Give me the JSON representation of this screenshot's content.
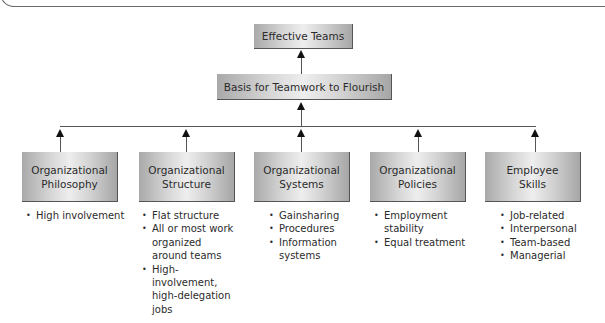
{
  "diagram": {
    "top": {
      "label": "Effective Teams"
    },
    "middle": {
      "label": "Basis for Teamwork to Flourish"
    },
    "factors": [
      {
        "line1": "Organizational",
        "line2": "Philosophy",
        "bullets": [
          "High involvement"
        ]
      },
      {
        "line1": "Organizational",
        "line2": "Structure",
        "bullets": [
          "Flat structure",
          "All or most work organized around teams",
          "High-involvement, high-delegation jobs"
        ]
      },
      {
        "line1": "Organizational",
        "line2": "Systems",
        "bullets": [
          "Gainsharing",
          "Procedures",
          "Information systems"
        ]
      },
      {
        "line1": "Organizational",
        "line2": "Policies",
        "bullets": [
          "Employment stability",
          "Equal treatment"
        ]
      },
      {
        "line1": "Employee",
        "line2": "Skills",
        "bullets": [
          "Job-related",
          "Interpersonal",
          "Team-based",
          "Managerial"
        ]
      }
    ]
  }
}
